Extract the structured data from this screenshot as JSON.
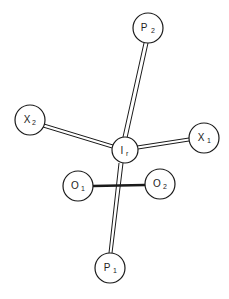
{
  "diagram": {
    "title": "",
    "colors": {
      "stroke": "#1a1a1a",
      "fill": "#ffffff",
      "background": "#ffffff"
    },
    "nodes": [
      {
        "id": "P2",
        "label": "P",
        "sub": "2",
        "cx": 148,
        "cy": 28,
        "r": 15
      },
      {
        "id": "X2",
        "label": "X",
        "sub": "2",
        "cx": 30,
        "cy": 120,
        "r": 15
      },
      {
        "id": "X1",
        "label": "X",
        "sub": "1",
        "cx": 204,
        "cy": 138,
        "r": 15
      },
      {
        "id": "Ir",
        "label": "I",
        "sub": "r",
        "cx": 125,
        "cy": 150,
        "r": 13
      },
      {
        "id": "O1",
        "label": "O",
        "sub": "1",
        "cx": 78,
        "cy": 186,
        "r": 15
      },
      {
        "id": "O2",
        "label": "O",
        "sub": "2",
        "cx": 160,
        "cy": 184,
        "r": 15
      },
      {
        "id": "P1",
        "label": "P",
        "sub": "1",
        "cx": 110,
        "cy": 268,
        "r": 15
      }
    ],
    "bonds": [
      {
        "from": "Ir",
        "to": "P2",
        "style": "double"
      },
      {
        "from": "Ir",
        "to": "X2",
        "style": "double"
      },
      {
        "from": "Ir",
        "to": "X1",
        "style": "double"
      },
      {
        "from": "Ir",
        "to": "P1",
        "style": "double"
      },
      {
        "from": "O1",
        "to": "O2",
        "style": "thick"
      }
    ]
  }
}
